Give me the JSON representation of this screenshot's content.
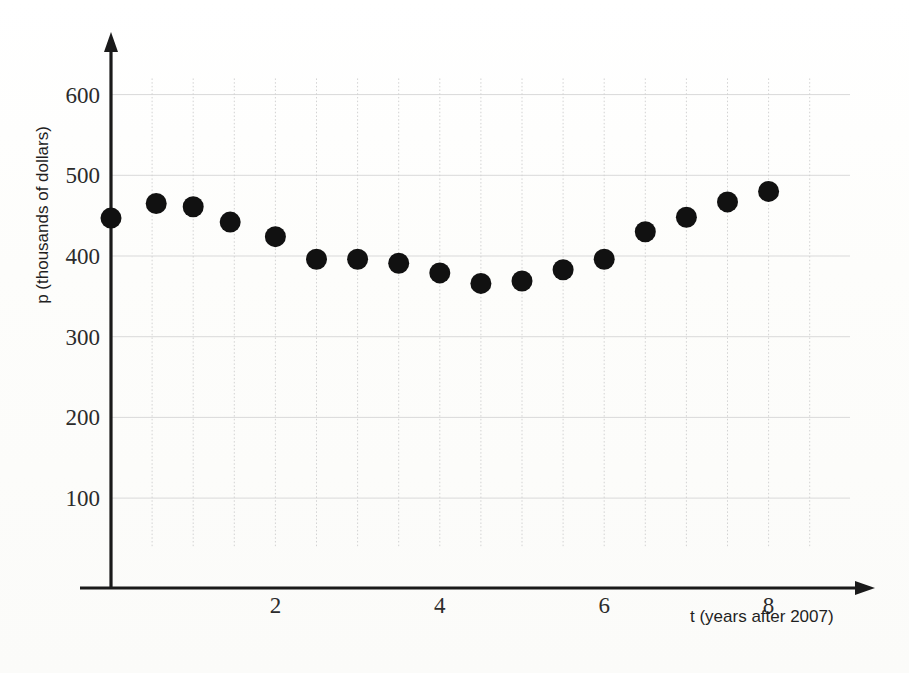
{
  "chart_data": {
    "type": "scatter",
    "title": "",
    "xlabel": "t (years after 2007)",
    "ylabel": "p (thousands of dollars)",
    "xlim": [
      0,
      9
    ],
    "ylim": [
      0,
      650
    ],
    "xticks": [
      2,
      4,
      6,
      8
    ],
    "yticks": [
      100,
      200,
      300,
      400,
      500,
      600
    ],
    "xtick_labels": [
      "2",
      "4",
      "6",
      "8"
    ],
    "ytick_labels": [
      "100",
      "200",
      "300",
      "400",
      "500",
      "600"
    ],
    "grid": true,
    "grid_x_step": 0.5,
    "grid_y_step": 100,
    "legend": null,
    "marker": "filled-circle",
    "marker_color": "#111111",
    "points": [
      {
        "t": 0.0,
        "p": 447
      },
      {
        "t": 0.55,
        "p": 465
      },
      {
        "t": 1.0,
        "p": 461
      },
      {
        "t": 1.45,
        "p": 442
      },
      {
        "t": 2.0,
        "p": 424
      },
      {
        "t": 2.5,
        "p": 396
      },
      {
        "t": 3.0,
        "p": 396
      },
      {
        "t": 3.5,
        "p": 391
      },
      {
        "t": 4.0,
        "p": 379
      },
      {
        "t": 4.5,
        "p": 366
      },
      {
        "t": 5.0,
        "p": 369
      },
      {
        "t": 5.5,
        "p": 383
      },
      {
        "t": 6.0,
        "p": 396
      },
      {
        "t": 6.5,
        "p": 430
      },
      {
        "t": 7.0,
        "p": 448
      },
      {
        "t": 7.5,
        "p": 467
      },
      {
        "t": 8.0,
        "p": 480
      }
    ]
  },
  "axes": {
    "x_axis_label": "t (years after 2007)",
    "y_axis_label": "p (thousands of dollars)"
  }
}
